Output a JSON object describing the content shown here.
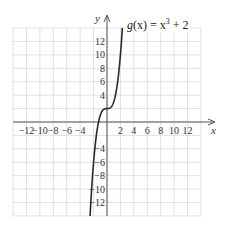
{
  "chart_data": {
    "type": "line",
    "title": "",
    "function_label": "g(x) = x³ + 2",
    "series": [
      {
        "name": "g(x) = x^3 + 2",
        "x": [
          -2.52,
          -2.25,
          -2,
          -1.75,
          -1.5,
          -1.25,
          -1,
          -0.75,
          -0.5,
          -0.25,
          0,
          0.25,
          0.5,
          0.75,
          1,
          1.25,
          1.5,
          1.75,
          2,
          2.29
        ],
        "values": [
          -14.0,
          -9.39,
          -6,
          -3.36,
          -1.375,
          0.047,
          1,
          1.578,
          1.875,
          1.984,
          2,
          2.016,
          2.125,
          2.422,
          3,
          3.953,
          5.375,
          7.359,
          10,
          14.0
        ]
      }
    ],
    "xlabel": "x",
    "ylabel": "y",
    "xlim": [
      -14,
      14
    ],
    "ylim": [
      -14,
      14
    ],
    "x_ticks": [
      -12,
      -10,
      -8,
      -6,
      -4,
      2,
      4,
      6,
      8,
      10,
      12
    ],
    "x_tick_labels": [
      "−12",
      "−10",
      "−8",
      "−6",
      "−4",
      "2",
      "4",
      "6",
      "8",
      "10",
      "12"
    ],
    "y_ticks": [
      12,
      10,
      8,
      6,
      4,
      -4,
      -6,
      -8,
      -10,
      -12
    ],
    "y_tick_labels": [
      "12",
      "10",
      "8",
      "6",
      "4",
      "−4",
      "−6",
      "−8",
      "−10",
      "−12"
    ],
    "grid": true,
    "grid_step": 2,
    "legend": "none"
  },
  "labels": {
    "x_axis": "x",
    "y_axis": "y",
    "function_name": "g",
    "function_arg": "(x)",
    "function_rhs_base": " = x",
    "function_rhs_exp": "3",
    "function_rhs_tail": " + 2"
  },
  "colors": {
    "grid": "#d9d9d9",
    "axis": "#555555",
    "curve": "#2a2a2a",
    "background": "#ffffff"
  }
}
